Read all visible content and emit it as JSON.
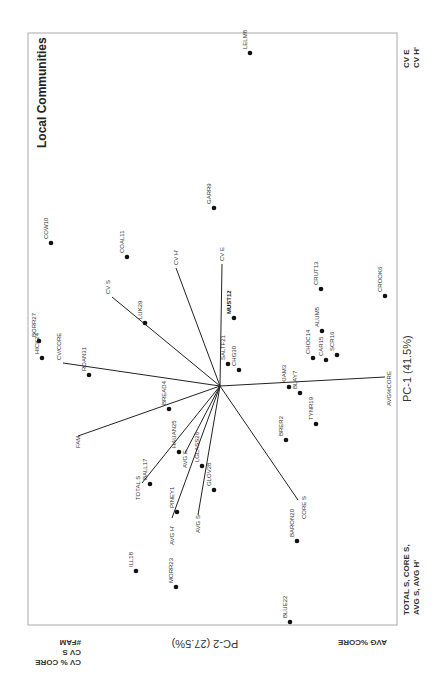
{
  "chart_data": {
    "type": "scatter",
    "subtype": "PCA biplot (rotated 90 degrees)",
    "title": "Local Communities",
    "xlabel": "PC-1 (41.5%)",
    "ylabel": "PC-2 (27.5%)",
    "grid": false,
    "points": [
      {
        "label": "LELM8",
        "x": -0.05,
        "y": 0.93
      },
      {
        "label": "GARR9",
        "x": 0.03,
        "y": 0.5
      },
      {
        "label": "COW10",
        "x": 0.47,
        "y": 0.4
      },
      {
        "label": "COAL11",
        "x": 0.26,
        "y": 0.36
      },
      {
        "label": "BORR27",
        "x": 0.49,
        "y": 0.12
      },
      {
        "label": "HICK24",
        "x": 0.48,
        "y": 0.08
      },
      {
        "label": "LUK29",
        "x": 0.23,
        "y": 0.17
      },
      {
        "label": "MUST12",
        "x": -0.04,
        "y": 0.19
      },
      {
        "label": "SALTF21",
        "x": -0.02,
        "y": 0.06
      },
      {
        "label": "CHG30",
        "x": -0.05,
        "y": 0.04
      },
      {
        "label": "CRUT13",
        "x": -0.27,
        "y": 0.27
      },
      {
        "label": "ALUM5",
        "x": -0.27,
        "y": 0.15
      },
      {
        "label": "CHOC14",
        "x": -0.25,
        "y": 0.08
      },
      {
        "label": "CAR15",
        "x": -0.29,
        "y": 0.07
      },
      {
        "label": "SCR16",
        "x": -0.32,
        "y": 0.09
      },
      {
        "label": "CROOK6",
        "x": -0.45,
        "y": 0.25
      },
      {
        "label": "ROAN31",
        "x": 0.36,
        "y": 0.03
      },
      {
        "label": "KIAM3",
        "x": -0.19,
        "y": 0.0
      },
      {
        "label": "BLAY7",
        "x": -0.22,
        "y": -0.02
      },
      {
        "label": "TYNR19",
        "x": -0.26,
        "y": -0.1
      },
      {
        "label": "BRER2",
        "x": -0.18,
        "y": -0.15
      },
      {
        "label": "BREAD4",
        "x": 0.14,
        "y": -0.06
      },
      {
        "label": "HAUAN25",
        "x": 0.11,
        "y": -0.18
      },
      {
        "label": "LGLASS26",
        "x": 0.05,
        "y": -0.22
      },
      {
        "label": "GLOV28",
        "x": 0.02,
        "y": -0.28
      },
      {
        "label": "BALL17",
        "x": 0.19,
        "y": -0.27
      },
      {
        "label": "PINEY1",
        "x": 0.12,
        "y": -0.35
      },
      {
        "label": "BARON20",
        "x": -0.21,
        "y": -0.43
      },
      {
        "label": "ILL18",
        "x": 0.23,
        "y": -0.51
      },
      {
        "label": "MORR23",
        "x": 0.12,
        "y": -0.56
      },
      {
        "label": "BLUE22",
        "x": -0.19,
        "y": -0.65
      }
    ],
    "vectors": [
      {
        "label": "CV S",
        "x": 0.3,
        "y": 0.24
      },
      {
        "label": "CV H'",
        "x": 0.12,
        "y": 0.33
      },
      {
        "label": "CV E",
        "x": 0.0,
        "y": 0.34
      },
      {
        "label": "CV/CORE",
        "x": 0.43,
        "y": 0.06
      },
      {
        "label": "FAM",
        "x": 0.39,
        "y": -0.14
      },
      {
        "label": "TOTAL S",
        "x": 0.21,
        "y": -0.27
      },
      {
        "label": "AVG H'",
        "x": 0.13,
        "y": -0.37
      },
      {
        "label": "AVG S",
        "x": 0.06,
        "y": -0.36
      },
      {
        "label": "AVG E",
        "x": 0.1,
        "y": -0.19
      },
      {
        "label": "CORE S",
        "x": -0.22,
        "y": -0.32
      },
      {
        "label": "AVG%CORE",
        "x": -0.45,
        "y": 0.03
      }
    ],
    "axis_end_labels": {
      "pc1_positive": "AVG %CORE",
      "pc1_negative": [
        "CV % CORE",
        "CV S",
        "#FAM"
      ],
      "pc2_positive": [
        "CV E",
        "CV H'"
      ],
      "pc2_negative": [
        "TOTAL S, CORE S,",
        "AVG S, AVG H'"
      ]
    }
  },
  "labels": {
    "title": "Local Communities",
    "pc1": "PC-1 (41.5%)",
    "pc2": "PC-2 (27.5%)",
    "top_right_1": "CV E",
    "top_right_2": "CV H'",
    "bottom_right_1": "TOTAL S, CORE S,",
    "bottom_right_2": "AVG S, AVG H'",
    "bottom_left_1": "CV % CORE",
    "bottom_left_2": "CV S",
    "bottom_left_3": "#FAM",
    "bottom_mid": "AVG %CORE"
  },
  "points": [
    {
      "name": "LELM8",
      "sx": 250,
      "sy": 53
    },
    {
      "name": "GARR9",
      "sx": 214,
      "sy": 208
    },
    {
      "name": "COW10",
      "sx": 51,
      "sy": 243
    },
    {
      "name": "COAL11",
      "sx": 127,
      "sy": 257
    },
    {
      "name": "BORR27",
      "sx": 39,
      "sy": 341
    },
    {
      "name": "HICK24",
      "sx": 42,
      "sy": 358
    },
    {
      "name": "LUK29",
      "sx": 145,
      "sy": 323
    },
    {
      "name": "MUST12",
      "sx": 234,
      "sy": 318
    },
    {
      "name": "SALTF21",
      "sx": 228,
      "sy": 364
    },
    {
      "name": "CHG30",
      "sx": 239,
      "sy": 370
    },
    {
      "name": "CRUT13",
      "sx": 321,
      "sy": 289
    },
    {
      "name": "ALUM5",
      "sx": 322,
      "sy": 331
    },
    {
      "name": "CHOC14",
      "sx": 313,
      "sy": 358
    },
    {
      "name": "CAR15",
      "sx": 326,
      "sy": 360
    },
    {
      "name": "SCR16",
      "sx": 337,
      "sy": 355
    },
    {
      "name": "CROOK6",
      "sx": 385,
      "sy": 296
    },
    {
      "name": "ROAN31",
      "sx": 89,
      "sy": 375
    },
    {
      "name": "KIAM3",
      "sx": 289,
      "sy": 387
    },
    {
      "name": "BLAY7",
      "sx": 300,
      "sy": 393
    },
    {
      "name": "TYNR19",
      "sx": 316,
      "sy": 424
    },
    {
      "name": "BRER2",
      "sx": 286,
      "sy": 440
    },
    {
      "name": "BREAD4",
      "sx": 169,
      "sy": 409
    },
    {
      "name": "HAUAN25",
      "sx": 179,
      "sy": 452
    },
    {
      "name": "LGLASS26",
      "sx": 202,
      "sy": 466
    },
    {
      "name": "GLOV28",
      "sx": 214,
      "sy": 490
    },
    {
      "name": "BALL17",
      "sx": 150,
      "sy": 484
    },
    {
      "name": "PINEY1",
      "sx": 177,
      "sy": 512
    },
    {
      "name": "BARON20",
      "sx": 297,
      "sy": 541
    },
    {
      "name": "ILL18",
      "sx": 136,
      "sy": 571
    },
    {
      "name": "MORR23",
      "sx": 176,
      "sy": 587
    },
    {
      "name": "BLUE22",
      "sx": 290,
      "sy": 622
    }
  ]
}
